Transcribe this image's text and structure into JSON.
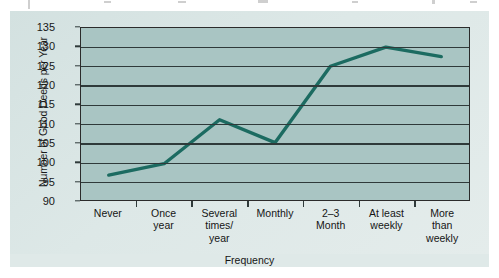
{
  "chart_data": {
    "type": "line",
    "title": "",
    "xlabel": "Frequency",
    "ylabel": "Number of Good Deeds per Year",
    "categories": [
      "Never",
      "Once\nyear",
      "Several\ntimes/\nyear",
      "Monthly",
      "2–3\nMonth",
      "At least\nweekly",
      "More\nthan\nweekly"
    ],
    "values": [
      96.5,
      99.5,
      111,
      105,
      125,
      130,
      127.5
    ],
    "ylim": [
      90,
      135
    ],
    "yticks": [
      90,
      95,
      100,
      105,
      110,
      115,
      120,
      125,
      130,
      135
    ],
    "grid": true,
    "legend": "none",
    "series": [
      {
        "name": "Good deeds",
        "values": [
          96.5,
          99.5,
          111,
          105,
          125,
          130,
          127.5
        ]
      }
    ]
  },
  "colors": {
    "line": "#1c6b61",
    "plot_background": "#a9c5c3",
    "figure_background": "#dde8e7",
    "gridline": "#2f3a3a",
    "axis": "#2b2b2b",
    "text": "#151515"
  }
}
